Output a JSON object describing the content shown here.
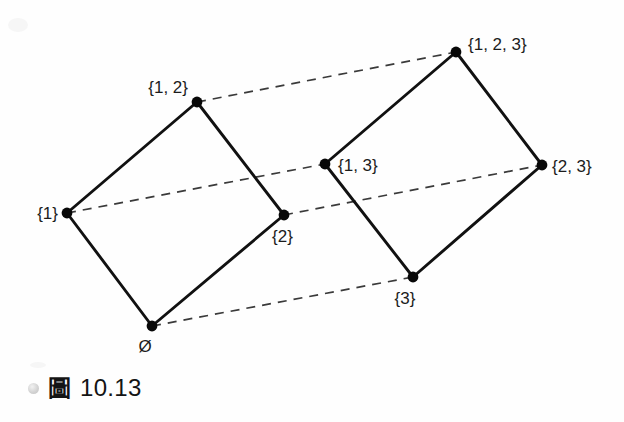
{
  "figure": {
    "kind": "hasse-diagram",
    "background_color": "#fefefe",
    "solid_edge_color": "#111111",
    "dashed_edge_color": "#3a3a3a",
    "node_color": "#080808",
    "label_color": "#1c1c1c",
    "nodes": [
      {
        "id": "empty",
        "label": "Ø",
        "x": 152,
        "y": 326,
        "label_x": 145,
        "label_y": 352,
        "anchor": "middle"
      },
      {
        "id": "s1",
        "label": "{1}",
        "x": 67,
        "y": 213,
        "label_x": 58,
        "label_y": 219,
        "anchor": "end"
      },
      {
        "id": "s2",
        "label": "{2}",
        "x": 284,
        "y": 215,
        "label_x": 272,
        "label_y": 242,
        "anchor": "start"
      },
      {
        "id": "s3",
        "label": "{3}",
        "x": 413,
        "y": 277,
        "label_x": 405,
        "label_y": 304,
        "anchor": "middle"
      },
      {
        "id": "s12",
        "label": "{1, 2}",
        "x": 197,
        "y": 102,
        "label_x": 188,
        "label_y": 93,
        "anchor": "end"
      },
      {
        "id": "s13",
        "label": "{1, 3}",
        "x": 325,
        "y": 164,
        "label_x": 338,
        "label_y": 171,
        "anchor": "start"
      },
      {
        "id": "s23",
        "label": "{2, 3}",
        "x": 542,
        "y": 165,
        "label_x": 552,
        "label_y": 172,
        "anchor": "start"
      },
      {
        "id": "s123",
        "label": "{1, 2, 3}",
        "x": 456,
        "y": 52,
        "label_x": 468,
        "label_y": 50,
        "anchor": "start"
      }
    ],
    "edges_solid": [
      {
        "from": "empty",
        "to": "s1"
      },
      {
        "from": "empty",
        "to": "s2"
      },
      {
        "from": "s1",
        "to": "s12"
      },
      {
        "from": "s2",
        "to": "s12"
      },
      {
        "from": "s3",
        "to": "s13"
      },
      {
        "from": "s3",
        "to": "s23"
      },
      {
        "from": "s13",
        "to": "s123"
      },
      {
        "from": "s23",
        "to": "s123"
      }
    ],
    "edges_dashed": [
      {
        "from": "empty",
        "to": "s3"
      },
      {
        "from": "s1",
        "to": "s13"
      },
      {
        "from": "s2",
        "to": "s23"
      },
      {
        "from": "s12",
        "to": "s123"
      }
    ]
  },
  "caption": {
    "bullet": "bullet-circle",
    "cjk_label": "圖",
    "number": "10.13"
  }
}
